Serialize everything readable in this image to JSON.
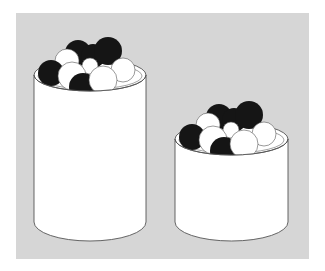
{
  "figure": {
    "background_color": "#d6d6d6",
    "jar_fill": "#ffffff",
    "outline_color": "#555555",
    "ball_colors": {
      "black": "#151515",
      "white": "#ffffff"
    },
    "jars": [
      {
        "name": "tall-jar",
        "size": "tall"
      },
      {
        "name": "short-jar",
        "size": "short"
      }
    ]
  }
}
